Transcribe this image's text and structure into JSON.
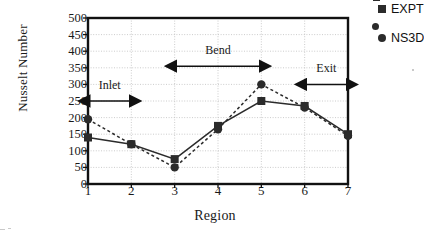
{
  "chart_data": {
    "type": "line",
    "title": "",
    "xlabel": "Region",
    "ylabel": "Nusselt Number",
    "categories": [
      1,
      2,
      3,
      4,
      5,
      6,
      7
    ],
    "x": [
      1,
      2,
      3,
      4,
      5,
      6,
      7
    ],
    "xlim": [
      1,
      7
    ],
    "ylim": [
      0,
      500
    ],
    "ytick_values": [
      0,
      50,
      100,
      150,
      200,
      250,
      300,
      350,
      400,
      450,
      500
    ],
    "ytick_labels": [
      "0",
      "50",
      "100",
      "150",
      "200",
      "250",
      "300",
      "350",
      "400",
      "450",
      "500"
    ],
    "xtick_labels": [
      "1",
      "2",
      "3",
      "4",
      "5",
      "6",
      "7"
    ],
    "grid": true,
    "grid_style": "dotted",
    "legend_position": "top-right-outside",
    "series": [
      {
        "name": "EXPT",
        "marker": "square",
        "line_style": "solid",
        "color": "#2b2b2b",
        "values": [
          140,
          120,
          75,
          175,
          250,
          235,
          150
        ]
      },
      {
        "name": "NS3D",
        "marker": "circle",
        "line_style": "dotted",
        "color": "#2b2b2b",
        "values": [
          195,
          120,
          50,
          165,
          300,
          230,
          145
        ]
      }
    ],
    "annotations": [
      {
        "label": "Inlet",
        "from_x": 1,
        "to_x": 2,
        "at_y": 250,
        "label_y": 295
      },
      {
        "label": "Bend",
        "from_x": 3,
        "to_x": 5,
        "at_y": 355,
        "label_y": 400
      },
      {
        "label": "Exit",
        "from_x": 6,
        "to_x": 7,
        "at_y": 300,
        "label_y": 345
      }
    ]
  },
  "legend": {
    "items": [
      {
        "label": "EXPT",
        "marker": "square"
      },
      {
        "label": "NS3D",
        "marker": "circle"
      }
    ]
  }
}
